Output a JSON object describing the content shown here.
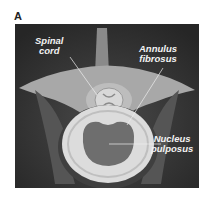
{
  "panel_letter": "A",
  "labels": {
    "spinal_cord": [
      "Spinal",
      "cord"
    ],
    "annulus_fibrosus": [
      "Annulus",
      "fibrosus"
    ],
    "nucleus_pulposus": [
      "Nucleus",
      "pulposus"
    ]
  },
  "colors": {
    "background": "#2e2e2e",
    "bone": "#9a9a9a",
    "annulus": "#dcdcdc",
    "nucleus": "#6e6e6e",
    "label_text": "#f2f2f2"
  }
}
